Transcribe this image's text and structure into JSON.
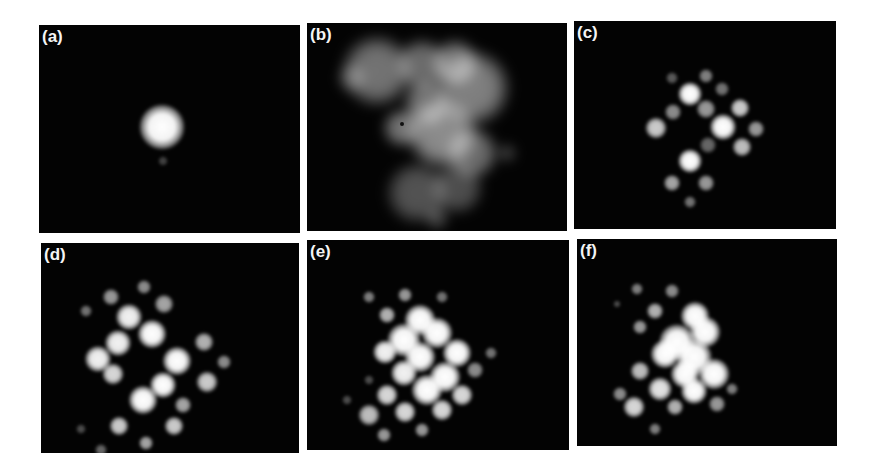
{
  "figure": {
    "background": "#ffffff",
    "panel_background": "#030303",
    "label_color": "#f4f4f4",
    "panels": [
      {
        "id": "a",
        "label": "(a)",
        "box": {
          "x": 39,
          "y": 25,
          "w": 261,
          "h": 208
        },
        "description": "single bright central spot",
        "spots": [
          {
            "x": 123,
            "y": 102,
            "r": 19,
            "b": 1.0
          },
          {
            "x": 124,
            "y": 136,
            "r": 4,
            "b": 0.25
          }
        ]
      },
      {
        "id": "b",
        "label": "(b)",
        "box": {
          "x": 307,
          "y": 23,
          "w": 260,
          "h": 208
        },
        "description": "diffuse grey cloud",
        "spots": [
          {
            "x": 70,
            "y": 48,
            "r": 30,
            "b": 0.45
          },
          {
            "x": 115,
            "y": 42,
            "r": 22,
            "b": 0.42
          },
          {
            "x": 148,
            "y": 40,
            "r": 20,
            "b": 0.45
          },
          {
            "x": 165,
            "y": 65,
            "r": 32,
            "b": 0.5
          },
          {
            "x": 135,
            "y": 110,
            "r": 30,
            "b": 0.55
          },
          {
            "x": 95,
            "y": 105,
            "r": 16,
            "b": 0.45
          },
          {
            "x": 120,
            "y": 80,
            "r": 20,
            "b": 0.45
          },
          {
            "x": 165,
            "y": 130,
            "r": 22,
            "b": 0.42
          },
          {
            "x": 110,
            "y": 170,
            "r": 26,
            "b": 0.32
          },
          {
            "x": 150,
            "y": 165,
            "r": 22,
            "b": 0.3
          },
          {
            "x": 130,
            "y": 195,
            "r": 10,
            "b": 0.25
          },
          {
            "x": 45,
            "y": 55,
            "r": 12,
            "b": 0.25
          },
          {
            "x": 200,
            "y": 130,
            "r": 8,
            "b": 0.22
          }
        ],
        "dark_dot": {
          "x": 95,
          "y": 101,
          "r": 2
        }
      },
      {
        "id": "c",
        "label": "(c)",
        "box": {
          "x": 574,
          "y": 21,
          "w": 262,
          "h": 208
        },
        "description": "lattice of discrete spots",
        "spots": [
          {
            "x": 116,
            "y": 73,
            "r": 10,
            "b": 1.0
          },
          {
            "x": 149,
            "y": 106,
            "r": 11,
            "b": 1.0
          },
          {
            "x": 116,
            "y": 140,
            "r": 10,
            "b": 1.0
          },
          {
            "x": 82,
            "y": 107,
            "r": 9,
            "b": 0.8
          },
          {
            "x": 166,
            "y": 87,
            "r": 8,
            "b": 0.8
          },
          {
            "x": 132,
            "y": 88,
            "r": 8,
            "b": 0.6
          },
          {
            "x": 99,
            "y": 91,
            "r": 7,
            "b": 0.55
          },
          {
            "x": 182,
            "y": 108,
            "r": 7,
            "b": 0.6
          },
          {
            "x": 168,
            "y": 126,
            "r": 8,
            "b": 0.75
          },
          {
            "x": 132,
            "y": 55,
            "r": 6,
            "b": 0.5
          },
          {
            "x": 148,
            "y": 68,
            "r": 6,
            "b": 0.45
          },
          {
            "x": 98,
            "y": 57,
            "r": 5,
            "b": 0.35
          },
          {
            "x": 98,
            "y": 162,
            "r": 7,
            "b": 0.65
          },
          {
            "x": 132,
            "y": 162,
            "r": 7,
            "b": 0.6
          },
          {
            "x": 116,
            "y": 181,
            "r": 5,
            "b": 0.45
          },
          {
            "x": 134,
            "y": 124,
            "r": 7,
            "b": 0.4
          }
        ]
      },
      {
        "id": "d",
        "label": "(d)",
        "box": {
          "x": 41,
          "y": 243,
          "w": 258,
          "h": 210
        },
        "description": "dense lattice, larger bright spots",
        "spots": [
          {
            "x": 70,
            "y": 54,
            "r": 7,
            "b": 0.6
          },
          {
            "x": 103,
            "y": 44,
            "r": 6,
            "b": 0.55
          },
          {
            "x": 45,
            "y": 68,
            "r": 5,
            "b": 0.45
          },
          {
            "x": 111,
            "y": 91,
            "r": 12,
            "b": 1.0
          },
          {
            "x": 88,
            "y": 74,
            "r": 11,
            "b": 0.95
          },
          {
            "x": 123,
            "y": 61,
            "r": 8,
            "b": 0.65
          },
          {
            "x": 77,
            "y": 100,
            "r": 11,
            "b": 0.95
          },
          {
            "x": 57,
            "y": 116,
            "r": 11,
            "b": 0.95
          },
          {
            "x": 136,
            "y": 118,
            "r": 12,
            "b": 1.0
          },
          {
            "x": 163,
            "y": 99,
            "r": 8,
            "b": 0.7
          },
          {
            "x": 72,
            "y": 131,
            "r": 9,
            "b": 0.85
          },
          {
            "x": 122,
            "y": 142,
            "r": 11,
            "b": 1.0
          },
          {
            "x": 102,
            "y": 157,
            "r": 12,
            "b": 1.0
          },
          {
            "x": 166,
            "y": 139,
            "r": 9,
            "b": 0.8
          },
          {
            "x": 183,
            "y": 119,
            "r": 6,
            "b": 0.55
          },
          {
            "x": 142,
            "y": 162,
            "r": 7,
            "b": 0.65
          },
          {
            "x": 78,
            "y": 183,
            "r": 8,
            "b": 0.8
          },
          {
            "x": 133,
            "y": 183,
            "r": 8,
            "b": 0.8
          },
          {
            "x": 105,
            "y": 200,
            "r": 6,
            "b": 0.65
          },
          {
            "x": 60,
            "y": 207,
            "r": 5,
            "b": 0.4
          },
          {
            "x": 40,
            "y": 186,
            "r": 4,
            "b": 0.3
          }
        ]
      },
      {
        "id": "e",
        "label": "(e)",
        "box": {
          "x": 307,
          "y": 240,
          "w": 262,
          "h": 210
        },
        "description": "lattice with merged bright central cluster",
        "spots": [
          {
            "x": 62,
            "y": 57,
            "r": 5,
            "b": 0.5
          },
          {
            "x": 98,
            "y": 55,
            "r": 6,
            "b": 0.6
          },
          {
            "x": 135,
            "y": 57,
            "r": 5,
            "b": 0.45
          },
          {
            "x": 80,
            "y": 75,
            "r": 7,
            "b": 0.7
          },
          {
            "x": 113,
            "y": 80,
            "r": 13,
            "b": 1.0
          },
          {
            "x": 130,
            "y": 93,
            "r": 13,
            "b": 1.0
          },
          {
            "x": 97,
            "y": 100,
            "r": 14,
            "b": 1.0
          },
          {
            "x": 78,
            "y": 112,
            "r": 10,
            "b": 0.95
          },
          {
            "x": 113,
            "y": 117,
            "r": 13,
            "b": 1.0
          },
          {
            "x": 150,
            "y": 113,
            "r": 12,
            "b": 1.0
          },
          {
            "x": 97,
            "y": 133,
            "r": 11,
            "b": 0.95
          },
          {
            "x": 138,
            "y": 137,
            "r": 13,
            "b": 1.0
          },
          {
            "x": 120,
            "y": 150,
            "r": 13,
            "b": 1.0
          },
          {
            "x": 155,
            "y": 155,
            "r": 9,
            "b": 0.85
          },
          {
            "x": 168,
            "y": 130,
            "r": 7,
            "b": 0.55
          },
          {
            "x": 184,
            "y": 113,
            "r": 5,
            "b": 0.45
          },
          {
            "x": 80,
            "y": 155,
            "r": 9,
            "b": 0.85
          },
          {
            "x": 98,
            "y": 172,
            "r": 9,
            "b": 0.85
          },
          {
            "x": 135,
            "y": 170,
            "r": 9,
            "b": 0.85
          },
          {
            "x": 62,
            "y": 175,
            "r": 9,
            "b": 0.75
          },
          {
            "x": 77,
            "y": 195,
            "r": 6,
            "b": 0.6
          },
          {
            "x": 115,
            "y": 190,
            "r": 6,
            "b": 0.6
          },
          {
            "x": 40,
            "y": 160,
            "r": 4,
            "b": 0.3
          },
          {
            "x": 62,
            "y": 140,
            "r": 4,
            "b": 0.3
          }
        ]
      },
      {
        "id": "f",
        "label": "(f)",
        "box": {
          "x": 577,
          "y": 239,
          "w": 260,
          "h": 207
        },
        "description": "lattice with large merged bright cluster",
        "spots": [
          {
            "x": 60,
            "y": 50,
            "r": 5,
            "b": 0.5
          },
          {
            "x": 95,
            "y": 52,
            "r": 6,
            "b": 0.55
          },
          {
            "x": 40,
            "y": 65,
            "r": 3,
            "b": 0.3
          },
          {
            "x": 78,
            "y": 72,
            "r": 7,
            "b": 0.7
          },
          {
            "x": 63,
            "y": 88,
            "r": 6,
            "b": 0.6
          },
          {
            "x": 118,
            "y": 77,
            "r": 12,
            "b": 1.0
          },
          {
            "x": 128,
            "y": 93,
            "r": 13,
            "b": 1.0
          },
          {
            "x": 100,
            "y": 103,
            "r": 15,
            "b": 1.0
          },
          {
            "x": 88,
            "y": 115,
            "r": 12,
            "b": 1.0
          },
          {
            "x": 117,
            "y": 118,
            "r": 15,
            "b": 1.0
          },
          {
            "x": 137,
            "y": 135,
            "r": 13,
            "b": 1.0
          },
          {
            "x": 108,
            "y": 135,
            "r": 12,
            "b": 1.0
          },
          {
            "x": 117,
            "y": 152,
            "r": 11,
            "b": 1.0
          },
          {
            "x": 140,
            "y": 165,
            "r": 7,
            "b": 0.6
          },
          {
            "x": 155,
            "y": 150,
            "r": 5,
            "b": 0.5
          },
          {
            "x": 63,
            "y": 132,
            "r": 8,
            "b": 0.75
          },
          {
            "x": 83,
            "y": 150,
            "r": 10,
            "b": 0.9
          },
          {
            "x": 57,
            "y": 168,
            "r": 9,
            "b": 0.85
          },
          {
            "x": 43,
            "y": 155,
            "r": 6,
            "b": 0.55
          },
          {
            "x": 98,
            "y": 168,
            "r": 7,
            "b": 0.7
          },
          {
            "x": 78,
            "y": 190,
            "r": 5,
            "b": 0.5
          }
        ]
      }
    ]
  }
}
